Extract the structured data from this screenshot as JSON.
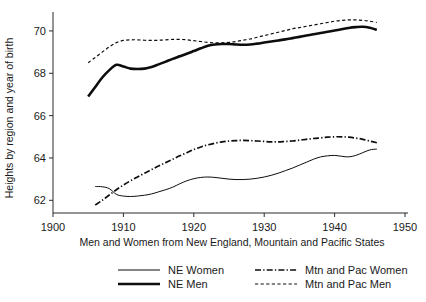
{
  "chart_data": {
    "type": "line",
    "title": "",
    "xlabel": "Men and Women from New England, Mountain and Pacific States",
    "ylabel": "Heights by region and year of birth",
    "xlim": [
      1900,
      1950
    ],
    "ylim": [
      61.4,
      70.8
    ],
    "grid": false,
    "legend_position": "bottom",
    "xticks": [
      1900,
      1910,
      1920,
      1930,
      1940,
      1950
    ],
    "xtick_labels": [
      "1900",
      "1910",
      "1920",
      "1930",
      "1940",
      "1950"
    ],
    "yticks": [
      62,
      64,
      66,
      68,
      70
    ],
    "ytick_labels": [
      "62",
      "64",
      "66",
      "68",
      "70"
    ],
    "series": [
      {
        "name": "NE Women",
        "style": "solid",
        "width": 1,
        "color": "#0d0d0d",
        "x": [
          1906,
          1907,
          1908,
          1909,
          1910,
          1911,
          1912,
          1913,
          1914,
          1915,
          1916,
          1917,
          1918,
          1919,
          1920,
          1921,
          1922,
          1923,
          1924,
          1925,
          1926,
          1927,
          1928,
          1929,
          1930,
          1931,
          1932,
          1933,
          1934,
          1935,
          1936,
          1937,
          1938,
          1939,
          1940,
          1941,
          1942,
          1943,
          1944,
          1945,
          1946
        ],
        "y": [
          62.65,
          62.64,
          62.55,
          62.28,
          62.2,
          62.18,
          62.2,
          62.24,
          62.3,
          62.4,
          62.5,
          62.62,
          62.78,
          62.92,
          63.02,
          63.08,
          63.1,
          63.08,
          63.04,
          63.0,
          62.98,
          62.98,
          63.0,
          63.04,
          63.1,
          63.18,
          63.28,
          63.4,
          63.52,
          63.66,
          63.8,
          63.94,
          64.05,
          64.1,
          64.12,
          64.08,
          64.05,
          64.12,
          64.25,
          64.38,
          64.42
        ]
      },
      {
        "name": "NE Men",
        "style": "solid",
        "width": 2.6,
        "color": "#0d0d0d",
        "x": [
          1905,
          1906,
          1907,
          1908,
          1909,
          1910,
          1911,
          1912,
          1913,
          1914,
          1915,
          1916,
          1917,
          1918,
          1919,
          1920,
          1921,
          1922,
          1923,
          1924,
          1925,
          1926,
          1927,
          1928,
          1929,
          1930,
          1931,
          1932,
          1933,
          1934,
          1935,
          1936,
          1937,
          1938,
          1939,
          1940,
          1941,
          1942,
          1943,
          1944,
          1945,
          1946
        ],
        "y": [
          66.9,
          67.35,
          67.8,
          68.15,
          68.4,
          68.32,
          68.22,
          68.2,
          68.22,
          68.3,
          68.42,
          68.55,
          68.68,
          68.8,
          68.92,
          69.05,
          69.18,
          69.3,
          69.36,
          69.38,
          69.38,
          69.36,
          69.35,
          69.36,
          69.4,
          69.45,
          69.5,
          69.55,
          69.6,
          69.66,
          69.72,
          69.78,
          69.84,
          69.9,
          69.96,
          70.02,
          70.08,
          70.14,
          70.18,
          70.2,
          70.15,
          70.05
        ]
      },
      {
        "name": "Mtn and Pac Women",
        "style": "dashdot",
        "width": 1.7,
        "color": "#0d0d0d",
        "x": [
          1906,
          1907,
          1908,
          1909,
          1910,
          1911,
          1912,
          1913,
          1914,
          1915,
          1916,
          1917,
          1918,
          1919,
          1920,
          1921,
          1922,
          1923,
          1924,
          1925,
          1926,
          1927,
          1928,
          1929,
          1930,
          1931,
          1932,
          1933,
          1934,
          1935,
          1936,
          1937,
          1938,
          1939,
          1940,
          1941,
          1942,
          1943,
          1944,
          1945,
          1946
        ],
        "y": [
          61.78,
          62.0,
          62.25,
          62.5,
          62.72,
          62.92,
          63.1,
          63.28,
          63.45,
          63.62,
          63.78,
          63.94,
          64.1,
          64.25,
          64.4,
          64.52,
          64.62,
          64.7,
          64.76,
          64.8,
          64.82,
          64.83,
          64.82,
          64.8,
          64.78,
          64.76,
          64.76,
          64.78,
          64.8,
          64.84,
          64.88,
          64.92,
          64.95,
          64.98,
          65.0,
          65.0,
          64.98,
          64.94,
          64.88,
          64.8,
          64.72
        ]
      },
      {
        "name": "Mtn and Pac Men",
        "style": "dashed",
        "width": 1.2,
        "color": "#0d0d0d",
        "x": [
          1905,
          1906,
          1907,
          1908,
          1909,
          1910,
          1911,
          1912,
          1913,
          1914,
          1915,
          1916,
          1917,
          1918,
          1919,
          1920,
          1921,
          1922,
          1923,
          1924,
          1925,
          1926,
          1927,
          1928,
          1929,
          1930,
          1931,
          1932,
          1933,
          1934,
          1935,
          1936,
          1937,
          1938,
          1939,
          1940,
          1941,
          1942,
          1943,
          1944,
          1945,
          1946
        ],
        "y": [
          68.5,
          68.75,
          69.0,
          69.25,
          69.45,
          69.55,
          69.58,
          69.58,
          69.56,
          69.55,
          69.56,
          69.58,
          69.6,
          69.6,
          69.58,
          69.54,
          69.5,
          69.46,
          69.44,
          69.44,
          69.46,
          69.5,
          69.56,
          69.62,
          69.7,
          69.78,
          69.86,
          69.94,
          70.02,
          70.1,
          70.16,
          70.22,
          70.28,
          70.34,
          70.4,
          70.46,
          70.5,
          70.52,
          70.52,
          70.5,
          70.46,
          70.4
        ]
      }
    ]
  },
  "legend": {
    "entries": [
      {
        "label": "NE Women",
        "style": "solid",
        "width": 1
      },
      {
        "label": "NE Men",
        "style": "solid",
        "width": 2.6
      },
      {
        "label": "Mtn and Pac Women",
        "style": "dashdot",
        "width": 1.7
      },
      {
        "label": "Mtn and Pac Men",
        "style": "dashed",
        "width": 1.2
      }
    ]
  },
  "colors": {
    "ink": "#0d0d0d",
    "axis": "#2b2b2b",
    "background": "#ffffff"
  }
}
